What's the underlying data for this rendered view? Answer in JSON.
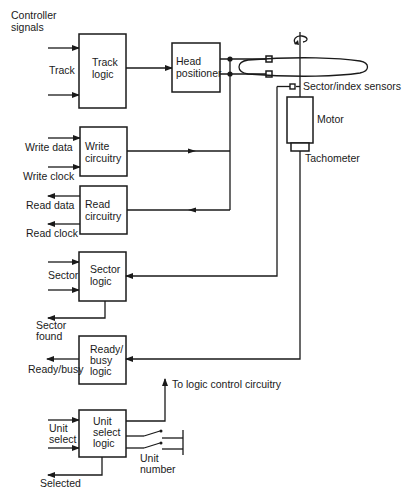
{
  "diagram": {
    "header": {
      "line1": "Controller",
      "line2": "signals"
    },
    "blocks": {
      "track_logic": {
        "line1": "Track",
        "line2": "logic"
      },
      "head_positioner": {
        "line1": "Head",
        "line2": "positioner"
      },
      "write_circuitry": {
        "line1": "Write",
        "line2": "circuitry"
      },
      "read_circuitry": {
        "line1": "Read",
        "line2": "circuitry"
      },
      "sector_logic": {
        "line1": "Sector",
        "line2": "logic"
      },
      "ready_busy_logic": {
        "line1": "Ready/",
        "line2": "busy",
        "line3": "logic"
      },
      "unit_select_logic": {
        "line1": "Unit",
        "line2": "select",
        "line3": "logic"
      },
      "motor": "Motor",
      "tachometer": "Tachometer"
    },
    "signals": {
      "track": "Track",
      "write_data": "Write data",
      "write_clock": "Write clock",
      "read_data": "Read data",
      "read_clock": "Read clock",
      "sector": "Sector",
      "sector_found_1": "Sector",
      "sector_found_2": "found",
      "ready_busy": "Ready/busy",
      "unit_select_1": "Unit",
      "unit_select_2": "select",
      "selected": "Selected",
      "unit_number_1": "Unit",
      "unit_number_2": "number",
      "to_logic_control": "To logic control circuitry",
      "sector_index_sensors": "Sector/index sensors"
    },
    "colors": {
      "ink": "#1a1a1a",
      "paper": "#ffffff"
    }
  }
}
